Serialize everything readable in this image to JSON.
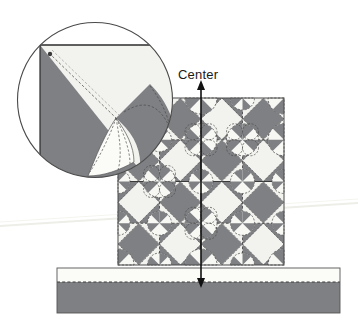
{
  "figure": {
    "annotations": {
      "center_label": "Center"
    },
    "colors": {
      "dark_fabric": "#7f8083",
      "light_fabric": "#f2f2ee",
      "white_fabric": "#fbfbf8",
      "outline": "#2b2b2b",
      "dashed_stitch": "#3a3a3a",
      "background": "#ffffff",
      "magnifier_ring": "#4a4a4a",
      "arrow": "#111111",
      "scan_artifact": "#efefe9"
    },
    "magnifier": {
      "name": "corner-detail-magnifier",
      "center_x": 95,
      "center_y": 100,
      "radius": 78,
      "marker_dot": {
        "x": 50,
        "y": 54
      }
    },
    "quilt": {
      "name": "quilt-top",
      "x": 118,
      "y": 98,
      "width": 166,
      "height": 167,
      "blocks_across": 2,
      "blocks_down": 2,
      "block_size": 83,
      "units_per_block": 2,
      "unit_size": 41.5
    },
    "border_strip": {
      "name": "border-strip",
      "x": 57,
      "y": 268,
      "width": 283,
      "height": 45,
      "light_band_height": 14,
      "seam_style": "dashed"
    },
    "center_arrow": {
      "name": "center-axis-arrow",
      "x": 201,
      "top_y": 82,
      "bottom_y": 284,
      "double_headed": true
    }
  }
}
